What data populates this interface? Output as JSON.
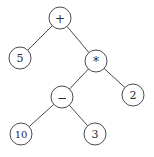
{
  "diagram": {
    "type": "binary-expression-tree",
    "expression": "5 + (10 - 3) * 2",
    "colors": {
      "background": "#ffffff",
      "stroke": "#4a4a52",
      "text": "#2a2a30",
      "node_fill": "#ffffff"
    },
    "geometry": {
      "width": 154,
      "height": 157,
      "node_radius": 11
    },
    "nodes": [
      {
        "id": "n0",
        "label": "+",
        "kind": "operator",
        "cx": 60,
        "cy": 18,
        "r": 11
      },
      {
        "id": "n1",
        "label": "5",
        "kind": "operand",
        "cx": 20,
        "cy": 58,
        "r": 11
      },
      {
        "id": "n2",
        "label": "*",
        "kind": "operator",
        "cx": 96,
        "cy": 61,
        "r": 11
      },
      {
        "id": "n3",
        "label": "−",
        "kind": "operator",
        "cx": 62,
        "cy": 97,
        "r": 11
      },
      {
        "id": "n4",
        "label": "2",
        "kind": "operand",
        "cx": 133,
        "cy": 95,
        "r": 11
      },
      {
        "id": "n5",
        "label": "10",
        "kind": "operand",
        "cx": 21,
        "cy": 134,
        "r": 11
      },
      {
        "id": "n6",
        "label": "3",
        "kind": "operand",
        "cx": 95,
        "cy": 134,
        "r": 11
      }
    ],
    "edges": [
      {
        "id": "e0",
        "from": "n0",
        "to": "n1",
        "side": "left"
      },
      {
        "id": "e1",
        "from": "n0",
        "to": "n2",
        "side": "right"
      },
      {
        "id": "e2",
        "from": "n2",
        "to": "n3",
        "side": "left"
      },
      {
        "id": "e3",
        "from": "n2",
        "to": "n4",
        "side": "right"
      },
      {
        "id": "e4",
        "from": "n3",
        "to": "n5",
        "side": "left"
      },
      {
        "id": "e5",
        "from": "n3",
        "to": "n6",
        "side": "right"
      }
    ]
  }
}
